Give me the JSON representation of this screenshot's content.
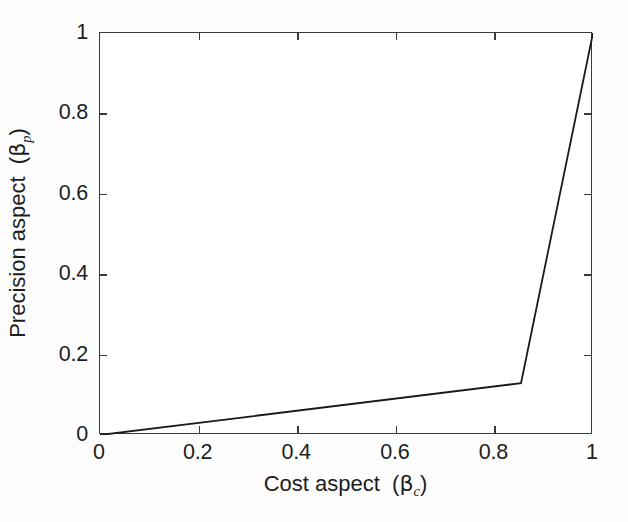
{
  "chart_data": {
    "type": "line",
    "title": "",
    "subtitle": "",
    "xlabel_text": "Cost aspect",
    "xlabel_symbol": "β",
    "xlabel_subscript": "c",
    "ylabel_text": "Precision aspect",
    "ylabel_symbol": "β",
    "ylabel_subscript": "p",
    "xlim": [
      0,
      1
    ],
    "ylim": [
      0,
      1
    ],
    "xticks": [
      0,
      0.2,
      0.4,
      0.6,
      0.8,
      1
    ],
    "yticks": [
      0,
      0.2,
      0.4,
      0.6,
      0.8,
      1
    ],
    "xticklabels": [
      "0",
      "0.2",
      "0.4",
      "0.6",
      "0.8",
      "1"
    ],
    "yticklabels": [
      "0",
      "0.2",
      "0.4",
      "0.6",
      "0.8",
      "1"
    ],
    "grid": false,
    "legend": null,
    "tick_direction": "in",
    "box": true,
    "series": [
      {
        "name": "tradeoff-curve",
        "color": "#1a1a1a",
        "linewidth": 1.8,
        "x": [
          0.0,
          0.854,
          1.0
        ],
        "y": [
          0.0,
          0.129,
          1.0
        ]
      }
    ],
    "annotations": [],
    "vertices": [
      {
        "label": "origin",
        "x": 0.0,
        "y": 0.0
      },
      {
        "label": "knee",
        "x": 0.854,
        "y": 0.129
      },
      {
        "label": "top-right",
        "x": 1.0,
        "y": 1.0
      }
    ]
  },
  "colors": {
    "axis": "#3a3a3a",
    "line": "#1a1a1a",
    "text": "#1d1d1d",
    "background": "#fdfdfd",
    "plot_background": "#ffffff"
  }
}
